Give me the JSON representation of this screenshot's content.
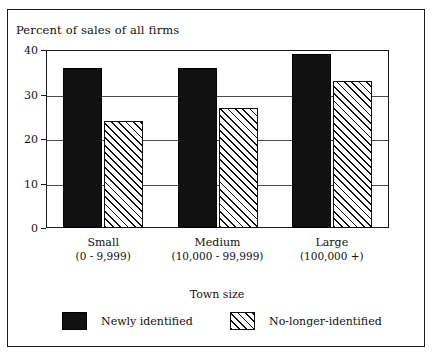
{
  "chart_data": {
    "type": "bar",
    "title": "Percent of sales of all firms",
    "xlabel": "Town size",
    "ylabel": "Percent of sales of all firms",
    "ylim": [
      0,
      40
    ],
    "yticks": [
      0,
      10,
      20,
      30,
      40
    ],
    "ytick_labels": [
      "0",
      "10",
      "20",
      "30",
      "40"
    ],
    "grid": true,
    "legend_position": "bottom",
    "categories": [
      "Small",
      "Medium",
      "Large"
    ],
    "category_ranges": [
      "(0 - 9,999)",
      "(10,000 - 99,999)",
      "(100,000 +)"
    ],
    "series": [
      {
        "name": "Newly identified",
        "pattern": "solid",
        "values": [
          36,
          36,
          39
        ]
      },
      {
        "name": "No-longer-identified",
        "pattern": "diagonal-hatch",
        "values": [
          24,
          27,
          33
        ]
      }
    ]
  },
  "legend": {
    "items": [
      {
        "label": "Newly identified",
        "swatch": "solid-black-swatch"
      },
      {
        "label": "No-longer-identified",
        "swatch": "hatched-swatch"
      }
    ]
  },
  "colors": {
    "series_1": "#111111",
    "series_2_outline": "#111111",
    "axis": "#1a1a1a",
    "grid": "#4a4a4a",
    "background": "#ffffff"
  }
}
